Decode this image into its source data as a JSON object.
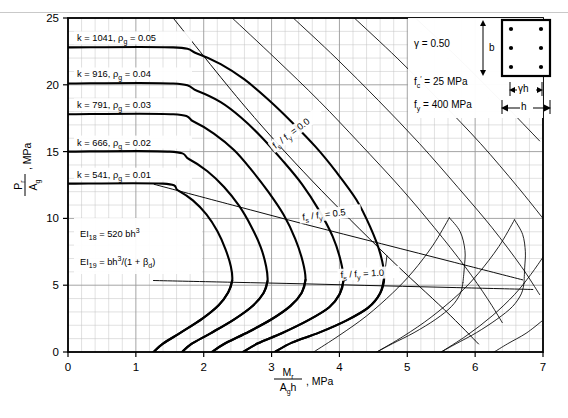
{
  "figure": {
    "kind": "column-interaction-diagram",
    "background": "#ffffff",
    "ink": "#000000",
    "grid_color": "#9a9a9a",
    "grid_minor_color": "#c3c3c3"
  },
  "axes": {
    "x": {
      "label_num": "M",
      "label_num_sub": "r",
      "label_den": "A",
      "label_den_sub": "g",
      "label_den_tail": "h",
      "units": ", MPa",
      "min": 0,
      "max": 7,
      "major_step": 1,
      "minor_step": 0.2,
      "ticks": [
        "0",
        "1",
        "2",
        "3",
        "4",
        "5",
        "6",
        "7"
      ]
    },
    "y": {
      "label_num": "P",
      "label_num_sub": "r",
      "label_den": "A",
      "label_den_sub": "g",
      "units": ", MPa",
      "min": 0,
      "max": 25,
      "major_step": 5,
      "minor_step": 1,
      "ticks": [
        "0",
        "5",
        "10",
        "15",
        "20",
        "25"
      ]
    }
  },
  "legend": {
    "gamma": {
      "symbol": "γ",
      "eq": "=",
      "value": "0.50"
    },
    "fc": {
      "symbol": "f",
      "sub": "c",
      "prime": "′",
      "eq": "=",
      "value": "25",
      "unit": "MPa"
    },
    "fy": {
      "symbol": "f",
      "sub": "y",
      "eq": "=",
      "value": "400",
      "unit": "MPa"
    },
    "section": {
      "width_label": "h",
      "height_label": "b",
      "core_label": "γh",
      "bars": 6,
      "bar_rows": 3,
      "bar_cols": 2
    }
  },
  "notes": [
    {
      "symbol": "EI",
      "sub": "18",
      "eq": "=",
      "value": "520 bh",
      "sup": "3"
    },
    {
      "symbol": "EI",
      "sub": "19",
      "eq": "=",
      "value": "bh",
      "sup": "3",
      "tail": "/(1 + β",
      "tail_sub": "d",
      "tail_end": ")"
    }
  ],
  "chart_data": {
    "type": "line",
    "title": "",
    "xlabel": "Mr / (Ag h), MPa",
    "ylabel": "Pr / Ag, MPa",
    "xlim": [
      0,
      7
    ],
    "ylim": [
      0,
      25
    ],
    "grid": true,
    "legend_position": "top-right-box",
    "series": [
      {
        "name": "k = 1041, rho_g = 0.05",
        "k": 1041,
        "rho_g": 0.05,
        "style": "thick",
        "points": [
          [
            0.0,
            22.8
          ],
          [
            1.55,
            22.8
          ],
          [
            1.9,
            22.35
          ],
          [
            2.25,
            21.55
          ],
          [
            2.6,
            20.4
          ],
          [
            2.95,
            18.9
          ],
          [
            3.3,
            17.2
          ],
          [
            3.65,
            15.35
          ],
          [
            3.95,
            13.5
          ],
          [
            4.25,
            11.4
          ],
          [
            4.45,
            9.4
          ],
          [
            4.6,
            7.4
          ],
          [
            4.66,
            5.6
          ],
          [
            4.6,
            4.4
          ],
          [
            4.42,
            3.3
          ],
          [
            4.1,
            2.35
          ],
          [
            3.7,
            1.45
          ],
          [
            3.3,
            0.7
          ],
          [
            3.05,
            0.0
          ]
        ]
      },
      {
        "name": "k = 916, rho_g = 0.04",
        "k": 916,
        "rho_g": 0.04,
        "style": "thick",
        "points": [
          [
            0.0,
            20.1
          ],
          [
            1.55,
            20.1
          ],
          [
            1.9,
            19.55
          ],
          [
            2.25,
            18.7
          ],
          [
            2.55,
            17.55
          ],
          [
            2.85,
            16.1
          ],
          [
            3.15,
            14.4
          ],
          [
            3.45,
            12.55
          ],
          [
            3.7,
            10.6
          ],
          [
            3.9,
            8.65
          ],
          [
            4.02,
            6.8
          ],
          [
            4.06,
            5.35
          ],
          [
            4.0,
            4.3
          ],
          [
            3.85,
            3.35
          ],
          [
            3.55,
            2.4
          ],
          [
            3.15,
            1.4
          ],
          [
            2.8,
            0.65
          ],
          [
            2.58,
            0.0
          ]
        ]
      },
      {
        "name": "k = 791, rho_g = 0.03",
        "k": 791,
        "rho_g": 0.03,
        "style": "thick",
        "points": [
          [
            0.0,
            17.8
          ],
          [
            1.55,
            17.8
          ],
          [
            1.85,
            17.25
          ],
          [
            2.15,
            16.35
          ],
          [
            2.45,
            15.1
          ],
          [
            2.7,
            13.65
          ],
          [
            2.95,
            12.0
          ],
          [
            3.18,
            10.25
          ],
          [
            3.35,
            8.45
          ],
          [
            3.46,
            6.75
          ],
          [
            3.5,
            5.4
          ],
          [
            3.44,
            4.4
          ],
          [
            3.28,
            3.45
          ],
          [
            3.0,
            2.45
          ],
          [
            2.62,
            1.4
          ],
          [
            2.3,
            0.6
          ],
          [
            2.12,
            0.0
          ]
        ]
      },
      {
        "name": "k = 666, rho_g = 0.02",
        "k": 666,
        "rho_g": 0.02,
        "style": "thick",
        "points": [
          [
            0.0,
            15.0
          ],
          [
            1.5,
            15.0
          ],
          [
            1.78,
            14.45
          ],
          [
            2.05,
            13.55
          ],
          [
            2.3,
            12.35
          ],
          [
            2.52,
            10.95
          ],
          [
            2.7,
            9.4
          ],
          [
            2.84,
            7.85
          ],
          [
            2.92,
            6.4
          ],
          [
            2.94,
            5.3
          ],
          [
            2.88,
            4.4
          ],
          [
            2.72,
            3.45
          ],
          [
            2.45,
            2.45
          ],
          [
            2.1,
            1.4
          ],
          [
            1.82,
            0.6
          ],
          [
            1.68,
            0.0
          ]
        ]
      },
      {
        "name": "k = 541, rho_g = 0.01",
        "k": 541,
        "rho_g": 0.01,
        "style": "thick",
        "points": [
          [
            0.0,
            12.6
          ],
          [
            1.4,
            12.6
          ],
          [
            1.62,
            12.1
          ],
          [
            1.84,
            11.35
          ],
          [
            2.04,
            10.3
          ],
          [
            2.2,
            9.05
          ],
          [
            2.32,
            7.7
          ],
          [
            2.4,
            6.4
          ],
          [
            2.42,
            5.35
          ],
          [
            2.36,
            4.45
          ],
          [
            2.22,
            3.5
          ],
          [
            1.98,
            2.5
          ],
          [
            1.66,
            1.45
          ],
          [
            1.4,
            0.62
          ],
          [
            1.26,
            0.0
          ]
        ]
      }
    ],
    "fs_ratio_lines": [
      {
        "label": "f_s / f_y = 0.0",
        "value": 0.0,
        "style": "thin",
        "label_rotation": -37,
        "points": [
          [
            1.55,
            25.0
          ],
          [
            2.62,
            18.3
          ],
          [
            3.6,
            12.8
          ],
          [
            4.7,
            7.2
          ],
          [
            5.55,
            3.15
          ],
          [
            6.05,
            0.6
          ]
        ]
      },
      {
        "label": "f_s / f_y = 0.5",
        "value": 0.5,
        "style": "thin",
        "label_rotation": -7,
        "points": [
          [
            1.27,
            12.55
          ],
          [
            2.42,
            11.0
          ],
          [
            3.5,
            9.55
          ],
          [
            4.62,
            8.1
          ],
          [
            5.7,
            6.7
          ],
          [
            6.7,
            5.4
          ]
        ]
      },
      {
        "label": "f_s / f_y = 1.0",
        "value": 1.0,
        "style": "thin",
        "label_rotation": -3,
        "points": [
          [
            1.26,
            5.35
          ],
          [
            2.42,
            5.22
          ],
          [
            3.5,
            5.1
          ],
          [
            4.66,
            4.95
          ],
          [
            5.72,
            4.82
          ],
          [
            6.85,
            4.68
          ]
        ]
      }
    ],
    "tail_curves": [
      {
        "name": "tail-0.01",
        "points": [
          [
            1.26,
            0.0
          ],
          [
            1.4,
            0.62
          ],
          [
            1.66,
            1.45
          ],
          [
            1.98,
            2.5
          ],
          [
            2.22,
            3.5
          ],
          [
            2.36,
            4.45
          ],
          [
            2.42,
            5.35
          ]
        ]
      },
      {
        "name": "tail-0.02",
        "points": [
          [
            1.68,
            0.0
          ],
          [
            1.82,
            0.6
          ],
          [
            2.1,
            1.4
          ],
          [
            2.45,
            2.45
          ],
          [
            2.72,
            3.45
          ],
          [
            2.88,
            4.4
          ],
          [
            2.94,
            5.3
          ]
        ]
      },
      {
        "name": "tail-0.03",
        "points": [
          [
            2.12,
            0.0
          ],
          [
            2.3,
            0.6
          ],
          [
            2.62,
            1.4
          ],
          [
            3.0,
            2.45
          ],
          [
            3.28,
            3.45
          ],
          [
            3.44,
            4.4
          ],
          [
            3.5,
            5.4
          ]
        ]
      },
      {
        "name": "tail-0.04",
        "points": [
          [
            2.58,
            0.0
          ],
          [
            2.8,
            0.65
          ],
          [
            3.15,
            1.4
          ],
          [
            3.55,
            2.4
          ],
          [
            3.85,
            3.35
          ],
          [
            4.0,
            4.3
          ],
          [
            4.06,
            5.35
          ]
        ]
      },
      {
        "name": "tail-0.05",
        "points": [
          [
            3.05,
            0.0
          ],
          [
            3.3,
            0.7
          ],
          [
            3.7,
            1.45
          ],
          [
            4.1,
            2.35
          ],
          [
            4.42,
            3.3
          ],
          [
            4.6,
            4.4
          ],
          [
            4.66,
            5.6
          ]
        ]
      },
      {
        "name": "thin-ext-1",
        "points": [
          [
            4.55,
            0.0
          ],
          [
            4.78,
            0.62
          ],
          [
            5.1,
            1.45
          ],
          [
            5.42,
            2.45
          ],
          [
            5.65,
            3.4
          ],
          [
            5.78,
            4.35
          ],
          [
            5.82,
            5.2
          ]
        ]
      },
      {
        "name": "thin-ext-2",
        "points": [
          [
            5.5,
            0.0
          ],
          [
            5.72,
            0.62
          ],
          [
            6.02,
            1.45
          ],
          [
            6.32,
            2.45
          ],
          [
            6.55,
            3.4
          ],
          [
            6.68,
            4.35
          ],
          [
            6.72,
            5.15
          ]
        ]
      },
      {
        "name": "thin-ext-3",
        "points": [
          [
            6.28,
            0.0
          ],
          [
            6.48,
            0.62
          ],
          [
            6.75,
            1.4
          ],
          [
            6.98,
            2.3
          ]
        ]
      },
      {
        "name": "thin-upper-1",
        "points": [
          [
            4.55,
            0.0
          ],
          [
            4.95,
            1.2
          ],
          [
            5.35,
            2.6
          ],
          [
            5.75,
            4.3
          ],
          [
            6.05,
            5.9
          ],
          [
            6.35,
            7.9
          ],
          [
            6.58,
            9.9
          ]
        ]
      },
      {
        "name": "thin-upper-2",
        "points": [
          [
            5.5,
            0.0
          ],
          [
            5.88,
            1.25
          ],
          [
            6.25,
            2.7
          ],
          [
            6.58,
            4.3
          ],
          [
            6.82,
            5.8
          ],
          [
            7.0,
            7.1
          ]
        ]
      },
      {
        "name": "thin-upper-3",
        "points": [
          [
            3.62,
            0.0
          ],
          [
            4.0,
            1.25
          ],
          [
            4.4,
            2.7
          ],
          [
            4.78,
            4.4
          ],
          [
            5.08,
            6.0
          ],
          [
            5.38,
            8.0
          ],
          [
            5.62,
            10.05
          ]
        ]
      }
    ],
    "upper_thin_curves": [
      {
        "name": "thin-top-a",
        "points": [
          [
            2.42,
            25.0
          ],
          [
            3.05,
            22.0
          ],
          [
            3.7,
            18.8
          ],
          [
            4.3,
            15.6
          ],
          [
            4.9,
            12.3
          ],
          [
            5.4,
            9.3
          ],
          [
            5.85,
            6.4
          ],
          [
            6.18,
            4.0
          ],
          [
            6.4,
            2.2
          ]
        ]
      },
      {
        "name": "thin-top-b",
        "points": [
          [
            3.32,
            25.0
          ],
          [
            3.95,
            22.0
          ],
          [
            4.58,
            18.8
          ],
          [
            5.18,
            15.6
          ],
          [
            5.75,
            12.3
          ],
          [
            6.25,
            9.3
          ],
          [
            6.68,
            6.4
          ],
          [
            6.95,
            4.3
          ]
        ]
      },
      {
        "name": "thin-top-c",
        "points": [
          [
            4.22,
            25.0
          ],
          [
            4.85,
            22.0
          ],
          [
            5.48,
            18.8
          ],
          [
            6.08,
            15.6
          ],
          [
            6.62,
            12.4
          ],
          [
            7.0,
            10.0
          ]
        ]
      },
      {
        "name": "thin-top-d",
        "points": [
          [
            5.12,
            25.0
          ],
          [
            5.75,
            22.0
          ],
          [
            6.38,
            18.8
          ],
          [
            6.95,
            15.8
          ]
        ]
      },
      {
        "name": "thin-right-vert",
        "points": [
          [
            5.62,
            10.05
          ],
          [
            5.78,
            9.0
          ],
          [
            5.85,
            7.6
          ],
          [
            5.84,
            6.3
          ],
          [
            5.82,
            5.2
          ]
        ]
      },
      {
        "name": "thin-right-vert-2",
        "points": [
          [
            6.58,
            9.9
          ],
          [
            6.7,
            8.8
          ],
          [
            6.74,
            7.5
          ],
          [
            6.73,
            6.3
          ],
          [
            6.72,
            5.15
          ]
        ]
      },
      {
        "name": "thin-mid-vert",
        "points": [
          [
            4.66,
            5.6
          ],
          [
            4.7,
            7.2
          ]
        ]
      }
    ]
  }
}
